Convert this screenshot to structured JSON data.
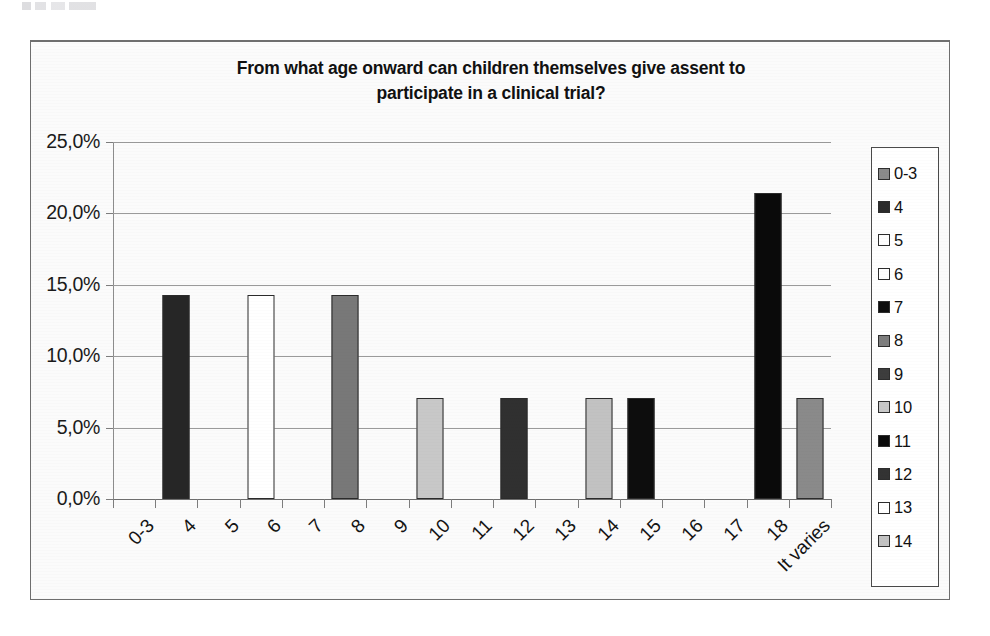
{
  "chart_data": {
    "type": "bar",
    "title": "From what age onward can children themselves give assent to participate in a clinical trial?",
    "title_line1": "From what age onward can children themselves give assent to",
    "title_line2": "participate in a clinical trial?",
    "xlabel": "",
    "ylabel": "",
    "grid": true,
    "legend_position": "right",
    "ylim": [
      0,
      25
    ],
    "ytick_labels": [
      "25,0%",
      "20,0%",
      "15,0%",
      "10,0%",
      "5,0%",
      "0,0%"
    ],
    "ytick_values": [
      25.0,
      20.0,
      15.0,
      10.0,
      5.0,
      0.0
    ],
    "categories": [
      "0-3",
      "4",
      "5",
      "6",
      "7",
      "8",
      "9",
      "10",
      "11",
      "12",
      "13",
      "14",
      "15",
      "16",
      "17",
      "18",
      "It varies"
    ],
    "values": [
      0,
      14.3,
      0,
      14.3,
      0,
      14.3,
      0,
      7.1,
      0,
      7.1,
      0,
      7.1,
      7.1,
      0,
      0,
      21.4,
      7.1
    ],
    "bar_colors": [
      "#808080",
      "#262626",
      "#ffffff",
      "#ffffff",
      "#0d0d0d",
      "#787878",
      "#3b3b3b",
      "#c8c8c8",
      "#0a0a0a",
      "#303030",
      "#ffffff",
      "#c2c2c2",
      "#0d0d0d",
      "#8a8a8a",
      "#4a4a4a",
      "#0a0a0a",
      "#8a8a8a"
    ],
    "legend_entries": [
      {
        "label": "0-3",
        "color": "#8a8a8a"
      },
      {
        "label": "4",
        "color": "#2b2b2b"
      },
      {
        "label": "5",
        "color": "#ffffff"
      },
      {
        "label": "6",
        "color": "#ffffff"
      },
      {
        "label": "7",
        "color": "#0d0d0d"
      },
      {
        "label": "8",
        "color": "#7d7d7d"
      },
      {
        "label": "9",
        "color": "#3d3d3d"
      },
      {
        "label": "10",
        "color": "#c8c8c8"
      },
      {
        "label": "11",
        "color": "#0a0a0a"
      },
      {
        "label": "12",
        "color": "#333333"
      },
      {
        "label": "13",
        "color": "#ffffff"
      },
      {
        "label": "14",
        "color": "#c2c2c2"
      }
    ]
  }
}
